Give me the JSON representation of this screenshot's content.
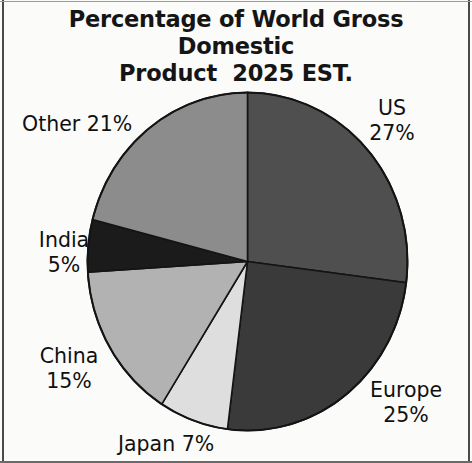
{
  "title": "Percentage of World Gross Domestic\nProduct  2025 EST.",
  "chart_data": {
    "type": "pie",
    "title": "Percentage of World Gross Domestic Product  2025 EST.",
    "xlabel": "",
    "ylabel": "",
    "grid": false,
    "legend": "none",
    "labels_position": "outside-around-pie",
    "units": "percent",
    "start_angle_deg": 0,
    "direction": "clockwise",
    "categories": [
      "US",
      "Europe",
      "Japan",
      "China",
      "India",
      "Other"
    ],
    "values": [
      27,
      25,
      7,
      15,
      5,
      21
    ],
    "slices": [
      {
        "name": "US",
        "value": 27,
        "label": "US\n27%",
        "label_text": "US 27%",
        "color": "#4f4f4f"
      },
      {
        "name": "Europe",
        "value": 25,
        "label": "Europe\n25%",
        "label_text": "Europe 25%",
        "color": "#3a3a3a"
      },
      {
        "name": "Japan",
        "value": 7,
        "label": "Japan 7%",
        "label_text": "Japan 7%",
        "color": "#dedede"
      },
      {
        "name": "China",
        "value": 15,
        "label": "China\n15%",
        "label_text": "China 15%",
        "color": "#b2b2b2"
      },
      {
        "name": "India",
        "value": 5,
        "label": "India\n5%",
        "label_text": "India 5%",
        "color": "#1b1b1b"
      },
      {
        "name": "Other",
        "value": 21,
        "label": "Other 21%",
        "label_text": "Other 21%",
        "color": "#8c8c8c"
      }
    ]
  },
  "labels": {
    "us": "US\n27%",
    "europe": "Europe\n25%",
    "japan": "Japan 7%",
    "china": "China\n15%",
    "india": "India\n5%",
    "other": "Other 21%"
  }
}
